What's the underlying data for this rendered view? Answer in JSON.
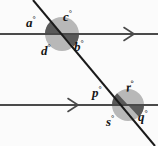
{
  "figure": {
    "background_color": "#fbfbfb",
    "line_color": "#4a4a4a",
    "transversal_color": "#1a1a1a",
    "circle_fill": "#b8b8b8",
    "wedge_fill": "#595959",
    "label_color": "#151515"
  },
  "lines": {
    "parallel_top": {
      "name": "top parallel line",
      "y": 34,
      "x_start": 0,
      "x_end": 158,
      "arrow_marker": "single-arrow-right",
      "arrow_x": 132
    },
    "parallel_bottom": {
      "name": "bottom parallel line",
      "y": 105,
      "x_start": 0,
      "x_end": 158,
      "arrow_marker": "single-arrow-right",
      "arrow_x": 76
    },
    "transversal": {
      "name": "transversal line",
      "x_start": 33,
      "y_start": 0,
      "x_end": 155,
      "y_end": 146
    }
  },
  "intersections": [
    {
      "id": "upper",
      "center_x": 62,
      "center_y": 34,
      "circle_radius": 17,
      "shaded_angles": [
        "a",
        "b"
      ],
      "unshaded_angles": [
        "c",
        "d"
      ]
    },
    {
      "id": "lower",
      "center_x": 128,
      "center_y": 105,
      "circle_radius": 16,
      "shaded_angles": [
        "p",
        "q"
      ],
      "unshaded_angles": [
        "r",
        "s"
      ]
    }
  ],
  "labels": {
    "a": {
      "text": "a",
      "degree": "°"
    },
    "b": {
      "text": "b",
      "degree": "°"
    },
    "c": {
      "text": "c",
      "degree": "°"
    },
    "d": {
      "text": "d",
      "degree": "°"
    },
    "p": {
      "text": "p",
      "degree": "°"
    },
    "q": {
      "text": "q",
      "degree": "°"
    },
    "r": {
      "text": "r",
      "degree": "°"
    },
    "s": {
      "text": "s",
      "degree": "°"
    }
  }
}
